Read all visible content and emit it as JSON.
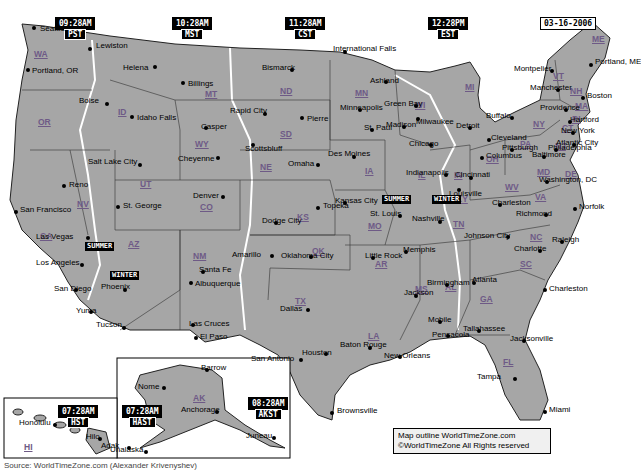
{
  "date": "03-16-2006",
  "time_zones": [
    {
      "id": "pst",
      "time": "09:28AM",
      "zone": "PST",
      "x": 55,
      "y": 17
    },
    {
      "id": "mst",
      "time": "10:28AM",
      "zone": "MST",
      "x": 172,
      "y": 17
    },
    {
      "id": "cst",
      "time": "11:28AM",
      "zone": "CST",
      "x": 285,
      "y": 17
    },
    {
      "id": "est",
      "time": "12:28PM",
      "zone": "EST",
      "x": 428,
      "y": 17
    },
    {
      "id": "hst",
      "time": "07:28AM",
      "zone": "HST",
      "x": 58,
      "y": 405
    },
    {
      "id": "hast",
      "time": "07:28AM",
      "zone": "HAST",
      "x": 122,
      "y": 405
    },
    {
      "id": "akst",
      "time": "08:28AM",
      "zone": "AKST",
      "x": 248,
      "y": 397
    }
  ],
  "states": [
    {
      "abbr": "WA",
      "x": 34,
      "y": 50
    },
    {
      "abbr": "OR",
      "x": 38,
      "y": 118
    },
    {
      "abbr": "CA",
      "x": 40,
      "y": 232
    },
    {
      "abbr": "NV",
      "x": 77,
      "y": 200
    },
    {
      "abbr": "ID",
      "x": 118,
      "y": 108
    },
    {
      "abbr": "MT",
      "x": 205,
      "y": 90
    },
    {
      "abbr": "WY",
      "x": 195,
      "y": 140
    },
    {
      "abbr": "UT",
      "x": 140,
      "y": 180
    },
    {
      "abbr": "CO",
      "x": 200,
      "y": 203
    },
    {
      "abbr": "AZ",
      "x": 128,
      "y": 240
    },
    {
      "abbr": "NM",
      "x": 193,
      "y": 252
    },
    {
      "abbr": "ND",
      "x": 280,
      "y": 87
    },
    {
      "abbr": "SD",
      "x": 280,
      "y": 130
    },
    {
      "abbr": "NE",
      "x": 260,
      "y": 163
    },
    {
      "abbr": "KS",
      "x": 297,
      "y": 213
    },
    {
      "abbr": "OK",
      "x": 312,
      "y": 247
    },
    {
      "abbr": "TX",
      "x": 295,
      "y": 297
    },
    {
      "abbr": "MN",
      "x": 355,
      "y": 89
    },
    {
      "abbr": "IA",
      "x": 365,
      "y": 167
    },
    {
      "abbr": "MO",
      "x": 368,
      "y": 222
    },
    {
      "abbr": "AR",
      "x": 375,
      "y": 260
    },
    {
      "abbr": "LA",
      "x": 368,
      "y": 332
    },
    {
      "abbr": "WI",
      "x": 415,
      "y": 101
    },
    {
      "abbr": "IL",
      "x": 418,
      "y": 171
    },
    {
      "abbr": "MS",
      "x": 415,
      "y": 285
    },
    {
      "abbr": "MI",
      "x": 465,
      "y": 83
    },
    {
      "abbr": "IN",
      "x": 454,
      "y": 171
    },
    {
      "abbr": "KY",
      "x": 456,
      "y": 195
    },
    {
      "abbr": "TN",
      "x": 453,
      "y": 220
    },
    {
      "abbr": "AL",
      "x": 445,
      "y": 283
    },
    {
      "abbr": "GA",
      "x": 480,
      "y": 295
    },
    {
      "abbr": "FL",
      "x": 503,
      "y": 358
    },
    {
      "abbr": "SC",
      "x": 520,
      "y": 260
    },
    {
      "abbr": "NC",
      "x": 530,
      "y": 233
    },
    {
      "abbr": "VA",
      "x": 535,
      "y": 193
    },
    {
      "abbr": "WV",
      "x": 505,
      "y": 183
    },
    {
      "abbr": "OH",
      "x": 486,
      "y": 155
    },
    {
      "abbr": "PA",
      "x": 520,
      "y": 140
    },
    {
      "abbr": "NY",
      "x": 533,
      "y": 120
    },
    {
      "abbr": "MD",
      "x": 537,
      "y": 168
    },
    {
      "abbr": "DE",
      "x": 565,
      "y": 170
    },
    {
      "abbr": "NJ",
      "x": 555,
      "y": 142
    },
    {
      "abbr": "CT",
      "x": 562,
      "y": 124
    },
    {
      "abbr": "RI",
      "x": 572,
      "y": 115
    },
    {
      "abbr": "MA",
      "x": 575,
      "y": 102
    },
    {
      "abbr": "NH",
      "x": 570,
      "y": 87
    },
    {
      "abbr": "VT",
      "x": 553,
      "y": 72
    },
    {
      "abbr": "ME",
      "x": 592,
      "y": 35
    },
    {
      "abbr": "AK",
      "x": 193,
      "y": 394
    },
    {
      "abbr": "HI",
      "x": 24,
      "y": 443
    }
  ],
  "cities": [
    {
      "name": "Seattle",
      "x": 34,
      "y": 28,
      "dx": 6,
      "dy": 0
    },
    {
      "name": "Lewiston",
      "x": 90,
      "y": 49,
      "dx": 6,
      "dy": -4
    },
    {
      "name": "Portland, OR",
      "x": 28,
      "y": 70,
      "dx": 4,
      "dy": 0
    },
    {
      "name": "Helena",
      "x": 155,
      "y": 67,
      "dx": -32,
      "dy": 0
    },
    {
      "name": "Billings",
      "x": 183,
      "y": 83,
      "dx": 5,
      "dy": 0
    },
    {
      "name": "Boise",
      "x": 107,
      "y": 104,
      "dx": -28,
      "dy": -4
    },
    {
      "name": "Idaho Falls",
      "x": 132,
      "y": 117,
      "dx": 5,
      "dy": 0
    },
    {
      "name": "Casper",
      "x": 206,
      "y": 128,
      "dx": -5,
      "dy": -2
    },
    {
      "name": "Cheyenne",
      "x": 218,
      "y": 158,
      "dx": -40,
      "dy": 0
    },
    {
      "name": "Rapid City",
      "x": 265,
      "y": 114,
      "dx": -35,
      "dy": -4
    },
    {
      "name": "Pierre",
      "x": 302,
      "y": 118,
      "dx": 5,
      "dy": 0
    },
    {
      "name": "Bismarck",
      "x": 292,
      "y": 70,
      "dx": -30,
      "dy": -3
    },
    {
      "name": "Scottsbluff",
      "x": 253,
      "y": 145,
      "dx": -8,
      "dy": 3
    },
    {
      "name": "Reno",
      "x": 64,
      "y": 186,
      "dx": 5,
      "dy": -2
    },
    {
      "name": "Salt Lake City",
      "x": 140,
      "y": 165,
      "dx": -52,
      "dy": -4
    },
    {
      "name": "San Francisco",
      "x": 16,
      "y": 212,
      "dx": 4,
      "dy": -3
    },
    {
      "name": "Las Vegas",
      "x": 88,
      "y": 238,
      "dx": -52,
      "dy": -2
    },
    {
      "name": "St. George",
      "x": 118,
      "y": 207,
      "dx": 5,
      "dy": -2
    },
    {
      "name": "Denver",
      "x": 223,
      "y": 197,
      "dx": -30,
      "dy": -2
    },
    {
      "name": "Los Angeles",
      "x": 82,
      "y": 265,
      "dx": -46,
      "dy": -3
    },
    {
      "name": "San Diego",
      "x": 76,
      "y": 290,
      "dx": -22,
      "dy": -2
    },
    {
      "name": "Phoenix",
      "x": 125,
      "y": 290,
      "dx": -24,
      "dy": -4
    },
    {
      "name": "Yuma",
      "x": 91,
      "y": 312,
      "dx": -15,
      "dy": -2
    },
    {
      "name": "Tucson",
      "x": 124,
      "y": 328,
      "dx": -28,
      "dy": -4
    },
    {
      "name": "Santa Fe",
      "x": 203,
      "y": 272,
      "dx": -4,
      "dy": -3
    },
    {
      "name": "Albuquerque",
      "x": 191,
      "y": 283,
      "dx": 4,
      "dy": 0
    },
    {
      "name": "Las Cruces",
      "x": 193,
      "y": 325,
      "dx": -4,
      "dy": -2
    },
    {
      "name": "El Paso",
      "x": 196,
      "y": 338,
      "dx": 4,
      "dy": -2
    },
    {
      "name": "Amarillo",
      "x": 272,
      "y": 256,
      "dx": -40,
      "dy": -2
    },
    {
      "name": "International Falls",
      "x": 345,
      "y": 52,
      "dx": -12,
      "dy": -4
    },
    {
      "name": "Minneapolis",
      "x": 360,
      "y": 110,
      "dx": -20,
      "dy": -3
    },
    {
      "name": "St. Paul",
      "x": 372,
      "y": 130,
      "dx": -8,
      "dy": -3
    },
    {
      "name": "Des Moines",
      "x": 354,
      "y": 157,
      "dx": -26,
      "dy": -4
    },
    {
      "name": "Omaha",
      "x": 318,
      "y": 165,
      "dx": -30,
      "dy": -2
    },
    {
      "name": "Topeka",
      "x": 318,
      "y": 208,
      "dx": 5,
      "dy": -3
    },
    {
      "name": "Dodge City",
      "x": 276,
      "y": 223,
      "dx": -14,
      "dy": -3
    },
    {
      "name": "Oklahoma City",
      "x": 311,
      "y": 257,
      "dx": -30,
      "dy": -2
    },
    {
      "name": "Kansas City",
      "x": 345,
      "y": 203,
      "dx": -10,
      "dy": -3
    },
    {
      "name": "St. Louis",
      "x": 400,
      "y": 216,
      "dx": -30,
      "dy": -3
    },
    {
      "name": "Little Rock",
      "x": 373,
      "y": 258,
      "dx": -8,
      "dy": -3
    },
    {
      "name": "Dallas",
      "x": 308,
      "y": 310,
      "dx": -28,
      "dy": -2
    },
    {
      "name": "Houston",
      "x": 326,
      "y": 354,
      "dx": -24,
      "dy": -2
    },
    {
      "name": "San Antonio",
      "x": 301,
      "y": 360,
      "dx": -50,
      "dy": -2
    },
    {
      "name": "Brownsville",
      "x": 332,
      "y": 413,
      "dx": 5,
      "dy": -3
    },
    {
      "name": "Baton Rouge",
      "x": 370,
      "y": 348,
      "dx": -30,
      "dy": -4
    },
    {
      "name": "New Orleans",
      "x": 400,
      "y": 357,
      "dx": -16,
      "dy": -2
    },
    {
      "name": "Ashland",
      "x": 386,
      "y": 82,
      "dx": -16,
      "dy": -2
    },
    {
      "name": "Green Bay",
      "x": 416,
      "y": 106,
      "dx": -32,
      "dy": -3
    },
    {
      "name": "Madison",
      "x": 404,
      "y": 127,
      "dx": -18,
      "dy": -3
    },
    {
      "name": "Milwaukee",
      "x": 418,
      "y": 119,
      "dx": -2,
      "dy": 2
    },
    {
      "name": "Chicago",
      "x": 431,
      "y": 145,
      "dx": -22,
      "dy": -2
    },
    {
      "name": "Indianapolis",
      "x": 446,
      "y": 175,
      "dx": -40,
      "dy": -3
    },
    {
      "name": "Detroit",
      "x": 470,
      "y": 128,
      "dx": -14,
      "dy": -3
    },
    {
      "name": "Cleveland",
      "x": 489,
      "y": 140,
      "dx": 2,
      "dy": -3
    },
    {
      "name": "Columbus",
      "x": 482,
      "y": 158,
      "dx": 4,
      "dy": -3
    },
    {
      "name": "Cincinnati",
      "x": 471,
      "y": 178,
      "dx": -16,
      "dy": -4
    },
    {
      "name": "Louisville",
      "x": 459,
      "y": 190,
      "dx": -10,
      "dy": 3
    },
    {
      "name": "Nashville",
      "x": 440,
      "y": 222,
      "dx": -28,
      "dy": -4
    },
    {
      "name": "Memphis",
      "x": 406,
      "y": 252,
      "dx": -3,
      "dy": -3
    },
    {
      "name": "Jackson",
      "x": 416,
      "y": 296,
      "dx": -12,
      "dy": -4
    },
    {
      "name": "Birmingham",
      "x": 447,
      "y": 285,
      "dx": -20,
      "dy": -3
    },
    {
      "name": "Atlanta",
      "x": 474,
      "y": 283,
      "dx": -2,
      "dy": -4
    },
    {
      "name": "Mobile",
      "x": 440,
      "y": 322,
      "dx": -12,
      "dy": -3
    },
    {
      "name": "Pensacola",
      "x": 448,
      "y": 336,
      "dx": -16,
      "dy": -2
    },
    {
      "name": "Tallahassee",
      "x": 479,
      "y": 331,
      "dx": -16,
      "dy": -3
    },
    {
      "name": "Jacksonville",
      "x": 524,
      "y": 341,
      "dx": -14,
      "dy": -3
    },
    {
      "name": "Tampa",
      "x": 515,
      "y": 379,
      "dx": -38,
      "dy": -3
    },
    {
      "name": "Miami",
      "x": 545,
      "y": 412,
      "dx": 4,
      "dy": -3
    },
    {
      "name": "Key West",
      "x": 509,
      "y": 436,
      "dx": -44,
      "dy": -2
    },
    {
      "name": "Charleston",
      "x": 545,
      "y": 290,
      "dx": 4,
      "dy": -2
    },
    {
      "name": "Charlotte",
      "x": 540,
      "y": 251,
      "dx": -26,
      "dy": -3
    },
    {
      "name": "Raleigh",
      "x": 562,
      "y": 242,
      "dx": -10,
      "dy": -3
    },
    {
      "name": "Johnson City",
      "x": 508,
      "y": 237,
      "dx": -44,
      "dy": -2
    },
    {
      "name": "Charleston",
      "x": 500,
      "y": 205,
      "dx": -8,
      "dy": -3
    },
    {
      "name": "Richmond",
      "x": 546,
      "y": 215,
      "dx": -30,
      "dy": -2
    },
    {
      "name": "Norfolk",
      "x": 575,
      "y": 209,
      "dx": 4,
      "dy": -3
    },
    {
      "name": "Washington, DC",
      "x": 547,
      "y": 182,
      "dx": -8,
      "dy": -3
    },
    {
      "name": "Baltimore",
      "x": 544,
      "y": 157,
      "dx": -12,
      "dy": -3
    },
    {
      "name": "Philadelphia",
      "x": 556,
      "y": 150,
      "dx": -8,
      "dy": -3
    },
    {
      "name": "Pittsburgh",
      "x": 512,
      "y": 150,
      "dx": -10,
      "dy": -3
    },
    {
      "name": "Atlantic City",
      "x": 574,
      "y": 145,
      "dx": -18,
      "dy": -3
    },
    {
      "name": "New York",
      "x": 573,
      "y": 133,
      "dx": -12,
      "dy": -3
    },
    {
      "name": "Hartford",
      "x": 570,
      "y": 122,
      "dx": 0,
      "dy": -3
    },
    {
      "name": "Providence",
      "x": 566,
      "y": 110,
      "dx": -26,
      "dy": -3
    },
    {
      "name": "Boston",
      "x": 583,
      "y": 98,
      "dx": 4,
      "dy": -3
    },
    {
      "name": "Manchester",
      "x": 558,
      "y": 90,
      "dx": -28,
      "dy": -3
    },
    {
      "name": "Montpelier",
      "x": 552,
      "y": 71,
      "dx": -38,
      "dy": -3
    },
    {
      "name": "Portland, ME",
      "x": 591,
      "y": 65,
      "dx": 4,
      "dy": -4
    },
    {
      "name": "Buffalo",
      "x": 512,
      "y": 118,
      "dx": -26,
      "dy": -3
    },
    {
      "name": "Barrow",
      "x": 207,
      "y": 370,
      "dx": -6,
      "dy": -3
    },
    {
      "name": "Nome",
      "x": 164,
      "y": 388,
      "dx": -26,
      "dy": -2
    },
    {
      "name": "Anchorage",
      "x": 217,
      "y": 412,
      "dx": -36,
      "dy": -3
    },
    {
      "name": "Adak",
      "x": 129,
      "y": 448,
      "dx": -28,
      "dy": -3
    },
    {
      "name": "Unalaska",
      "x": 146,
      "y": 452,
      "dx": -36,
      "dy": -3
    },
    {
      "name": "Juneau",
      "x": 274,
      "y": 438,
      "dx": -28,
      "dy": -3
    },
    {
      "name": "Honolulu",
      "x": 55,
      "y": 425,
      "dx": -36,
      "dy": -3
    },
    {
      "name": "Hilo",
      "x": 100,
      "y": 439,
      "dx": -14,
      "dy": -3
    }
  ],
  "season_labels": [
    {
      "text": "SUMMER",
      "x": 85,
      "y": 242
    },
    {
      "text": "WINTER",
      "x": 110,
      "y": 271
    },
    {
      "text": "SUMMER",
      "x": 382,
      "y": 195
    },
    {
      "text": "WINTER",
      "x": 432,
      "y": 195
    }
  ],
  "legend": {
    "line1": "Map outline WorldTimeZone.com",
    "line2": "©WorldTimeZone  All Rights reserved"
  },
  "footer": "Source: WorldTimeZone.com (Alexander Krivenyshev)",
  "colors": {
    "land": "#a6a6a6",
    "border": "#222222",
    "zone_border": "#ffffff",
    "state_label": "#6e5a86",
    "water": "#ffffff"
  }
}
